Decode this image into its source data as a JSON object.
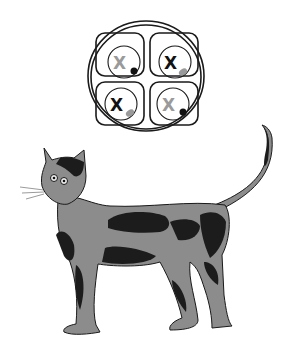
{
  "figure": {
    "cells": [
      {
        "position": "top-left",
        "label": "X",
        "label_shade": "inactive",
        "dot": "active"
      },
      {
        "position": "top-right",
        "label": "X",
        "label_shade": "active",
        "dot": "inactive"
      },
      {
        "position": "bottom-left",
        "label": "X",
        "label_shade": "active",
        "dot": "inactive"
      },
      {
        "position": "bottom-right",
        "label": "X",
        "label_shade": "inactive",
        "dot": "active"
      }
    ],
    "colors": {
      "background": "#ffffff",
      "outline": "#1a1a1a",
      "active": "#111111",
      "inactive": "#9a9a9a",
      "fur_light": "#8c8c8c",
      "fur_dark": "#1c1c1c"
    }
  }
}
